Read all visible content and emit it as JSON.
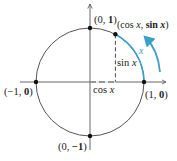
{
  "diagram": {
    "type": "unit-circle",
    "center": [
      90,
      82
    ],
    "radius": 54,
    "angle_deg": 62,
    "colors": {
      "circle": "#555555",
      "axes": "#555555",
      "arc": "#3aa0c8",
      "points": "#111111",
      "text": "#222222"
    },
    "points": {
      "top": {
        "label_pre": "(0, ",
        "label_bold": "1",
        "label_post": ")"
      },
      "left": {
        "label_pre": "(−1, ",
        "label_bold": "0",
        "label_post": ")"
      },
      "right": {
        "label_pre": "(1, ",
        "label_bold": "0",
        "label_post": ")"
      },
      "bottom": {
        "label_pre": "(0, ",
        "label_bold": "−1",
        "label_post": ")"
      },
      "on_circle": {
        "label_pre": "(cos ",
        "label_x1": "x",
        "label_mid": ", ",
        "label_bold": "sin",
        "label_x2": " x",
        "label_post": ")"
      }
    },
    "segment_labels": {
      "sin": {
        "fn": "sin ",
        "var": "x"
      },
      "cos": {
        "fn": "cos ",
        "var": "x"
      },
      "arc": "x"
    }
  }
}
